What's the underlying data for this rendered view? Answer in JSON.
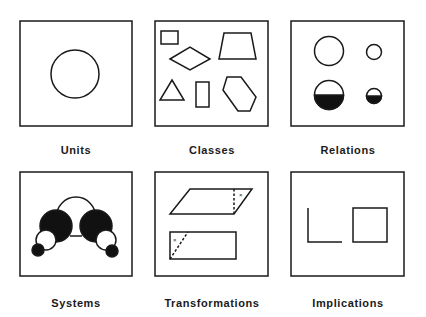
{
  "panels": [
    {
      "id": "units",
      "label": "Units",
      "shape": "circle-icon"
    },
    {
      "id": "classes",
      "label": "Classes",
      "shape": "assorted-polygons-icon"
    },
    {
      "id": "relations",
      "label": "Relations",
      "shape": "circle-pairs-icon"
    },
    {
      "id": "systems",
      "label": "Systems",
      "shape": "molecule-icon"
    },
    {
      "id": "transformations",
      "label": "Transformations",
      "shape": "parallelogram-rectangle-icon"
    },
    {
      "id": "implications",
      "label": "Implications",
      "shape": "l-to-square-icon"
    }
  ],
  "colors": {
    "stroke": "#1a1a1a",
    "fill": "#111111",
    "background": "#ffffff"
  }
}
